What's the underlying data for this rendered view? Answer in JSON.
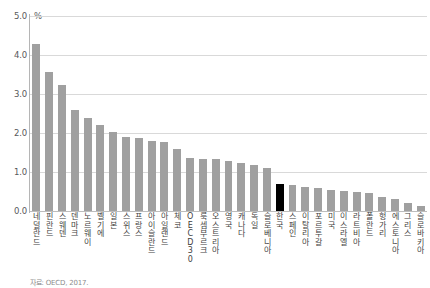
{
  "chart_data": {
    "type": "bar",
    "title": "",
    "subtitle": "",
    "xlabel": "",
    "ylabel": "%",
    "unit_label": "%",
    "ylim": [
      0.0,
      5.0
    ],
    "ytick_labels": [
      "5.0",
      "4.0",
      "3.0",
      "2.0",
      "1.0",
      "0.0"
    ],
    "ytick_values": [
      5.0,
      4.0,
      3.0,
      2.0,
      1.0,
      0.0
    ],
    "grid": true,
    "legend": "none",
    "bar_color": "#a0a0a0",
    "highlight_color": "#000000",
    "highlight_category": "한국",
    "categories": [
      "네덜란드",
      "핀란드",
      "스웨덴",
      "덴마크",
      "노르웨이",
      "벨기에",
      "일본",
      "스위스",
      "프랑스",
      "아이슬란드",
      "아일랜드",
      "체코",
      "OECD 30",
      "룩셈부르크",
      "오스트리아",
      "영국",
      "캐나다",
      "독일",
      "슬로베니아",
      "한국",
      "스페인",
      "이탈리아",
      "포르투갈",
      "미국",
      "이스라엘",
      "라트비아",
      "폴란드",
      "헝가리",
      "에스토니아",
      "그리스",
      "슬로바키아"
    ],
    "values": [
      4.28,
      3.56,
      3.23,
      2.58,
      2.38,
      2.2,
      2.03,
      1.9,
      1.87,
      1.8,
      1.78,
      1.6,
      1.35,
      1.34,
      1.33,
      1.28,
      1.22,
      1.18,
      1.1,
      0.7,
      0.66,
      0.62,
      0.6,
      0.55,
      0.52,
      0.48,
      0.45,
      0.37,
      0.32,
      0.2,
      0.12
    ],
    "footnote": "자료: OECD, 2017."
  }
}
